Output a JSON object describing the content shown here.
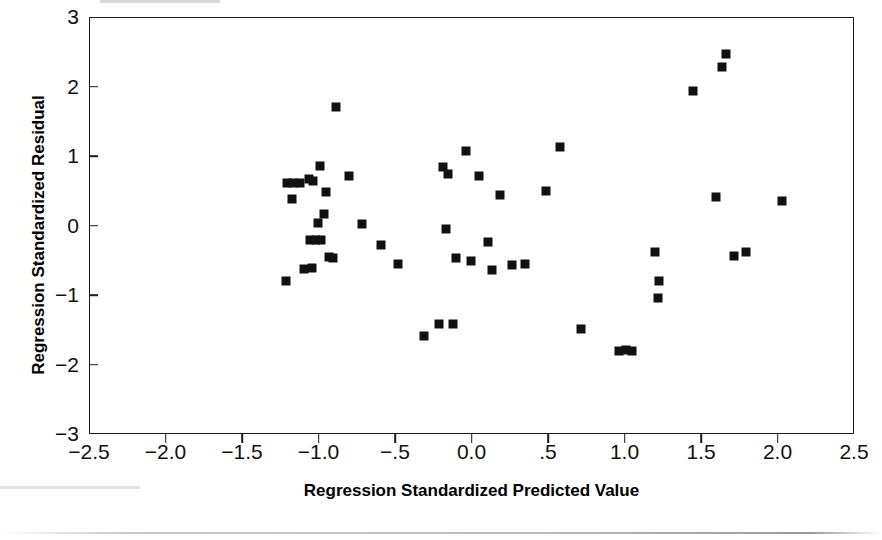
{
  "figure": {
    "background_color": "#ffffff",
    "ink_color": "#111111",
    "frame_color": "#1a1a1a",
    "marker_shape": "filled-square",
    "marker_size_px": 9
  },
  "axes": {
    "x_title": "Regression Standardized Predicted Value",
    "y_title": "Regression Standardized Residual",
    "x_tick_labels": [
      "-2.5",
      "-2.0",
      "-1.5",
      "-1.0",
      "-.5",
      "0.0",
      ".5",
      "1.0",
      "1.5",
      "2.0",
      "2.5"
    ],
    "x_tick_values": [
      -2.5,
      -2.0,
      -1.5,
      -1.0,
      -0.5,
      0.0,
      0.5,
      1.0,
      1.5,
      2.0,
      2.5
    ],
    "y_tick_labels": [
      "3",
      "2",
      "1",
      "0",
      "-1",
      "-2",
      "-3"
    ],
    "y_tick_values": [
      3,
      2,
      1,
      0,
      -1,
      -2,
      -3
    ]
  },
  "chart_data": {
    "type": "scatter",
    "title": "",
    "xlabel": "Regression Standardized Predicted Value",
    "ylabel": "Regression Standardized Residual",
    "xlim": [
      -2.5,
      2.5
    ],
    "ylim": [
      -3,
      3
    ],
    "grid": false,
    "legend": null,
    "series": [
      {
        "name": "Residuals",
        "marker": "square",
        "color": "#111111",
        "points": [
          [
            -1.21,
            0.62
          ],
          [
            -1.17,
            0.62
          ],
          [
            -1.13,
            0.62
          ],
          [
            -1.22,
            -0.78
          ],
          [
            -1.18,
            0.4
          ],
          [
            -1.07,
            0.69
          ],
          [
            -1.04,
            0.66
          ],
          [
            -1.06,
            -0.19
          ],
          [
            -1.02,
            -0.19
          ],
          [
            -0.99,
            -0.2
          ],
          [
            -1.0,
            0.87
          ],
          [
            -1.01,
            0.05
          ],
          [
            -0.97,
            0.18
          ],
          [
            -0.96,
            0.5
          ],
          [
            -1.1,
            -0.61
          ],
          [
            -1.05,
            -0.59
          ],
          [
            -0.89,
            1.72
          ],
          [
            -0.81,
            0.73
          ],
          [
            -0.94,
            -0.44
          ],
          [
            -0.91,
            -0.46
          ],
          [
            -0.72,
            0.03
          ],
          [
            -0.6,
            -0.27
          ],
          [
            -0.49,
            -0.54
          ],
          [
            -0.32,
            -1.58
          ],
          [
            -0.22,
            -1.41
          ],
          [
            -0.13,
            -1.4
          ],
          [
            -0.19,
            0.86
          ],
          [
            -0.16,
            0.76
          ],
          [
            -0.17,
            -0.04
          ],
          [
            -0.11,
            -0.46
          ],
          [
            -0.04,
            1.08
          ],
          [
            -0.01,
            -0.49
          ],
          [
            0.04,
            0.72
          ],
          [
            0.13,
            -0.62
          ],
          [
            0.18,
            0.45
          ],
          [
            0.1,
            -0.23
          ],
          [
            0.26,
            -0.55
          ],
          [
            0.34,
            -0.54
          ],
          [
            0.48,
            0.51
          ],
          [
            0.57,
            1.15
          ],
          [
            0.71,
            -1.47
          ],
          [
            0.96,
            -1.79
          ],
          [
            1.0,
            -1.78
          ],
          [
            1.04,
            -1.79
          ],
          [
            1.19,
            -0.37
          ],
          [
            1.22,
            -0.79
          ],
          [
            1.21,
            -1.03
          ],
          [
            1.44,
            1.95
          ],
          [
            1.59,
            0.43
          ],
          [
            1.63,
            2.29
          ],
          [
            1.66,
            2.48
          ],
          [
            1.71,
            -0.42
          ],
          [
            1.79,
            -0.36
          ],
          [
            2.02,
            0.37
          ]
        ]
      }
    ]
  }
}
